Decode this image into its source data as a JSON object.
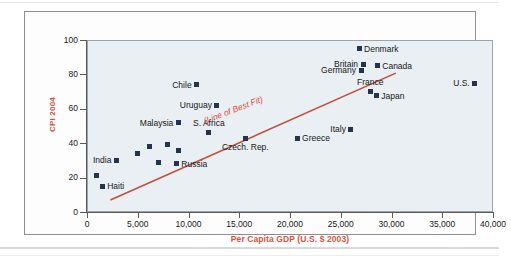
{
  "figure": {
    "background_color": "#e9eff2",
    "accent_color": "#d94f3d",
    "marker_color": "#24344d"
  },
  "chart_data": {
    "type": "scatter",
    "title": "",
    "xlabel": "Per Capita GDP (U.S. $ 2003)",
    "ylabel": "CPI 2004",
    "xlim": [
      0,
      40000
    ],
    "ylim": [
      0,
      100
    ],
    "grid": false,
    "legend": "none",
    "xticks": [
      0,
      5000,
      10000,
      15000,
      20000,
      25000,
      30000,
      35000,
      40000
    ],
    "xticklabels": [
      "0",
      "5,000",
      "10,000",
      "15,000",
      "20,000",
      "25,000",
      "30,000",
      "35,000",
      "40,000"
    ],
    "yticks": [
      0,
      20,
      40,
      60,
      80,
      100
    ],
    "yticklabels": [
      "0",
      "20",
      "40",
      "60",
      "80",
      "100"
    ],
    "annotations": [
      {
        "text": "(Line of Best Fit)",
        "x": 11500,
        "y": 53,
        "color": "#d94f3d",
        "style": "italic",
        "rotation_deg": -21
      }
    ],
    "best_fit_line": {
      "x_start": 0,
      "y_start": 13.5,
      "x_end": 28000,
      "y_end": 87,
      "color": "#c0503f"
    },
    "points": [
      {
        "name": "Haiti",
        "x": 1500,
        "y": 15.0,
        "label": "Haiti",
        "label_pos": "right"
      },
      {
        "name": "unlabeled-1",
        "x": 900,
        "y": 21.0,
        "label": "",
        "label_pos": "right"
      },
      {
        "name": "India",
        "x": 2900,
        "y": 30.0,
        "label": "India",
        "label_pos": "left"
      },
      {
        "name": "unlabeled-2",
        "x": 5000,
        "y": 34.0,
        "label": "",
        "label_pos": "right"
      },
      {
        "name": "unlabeled-3",
        "x": 6200,
        "y": 38.0,
        "label": "",
        "label_pos": "right"
      },
      {
        "name": "unlabeled-4",
        "x": 7000,
        "y": 29.0,
        "label": "",
        "label_pos": "right"
      },
      {
        "name": "unlabeled-5",
        "x": 7900,
        "y": 39.5,
        "label": "",
        "label_pos": "right"
      },
      {
        "name": "unlabeled-6",
        "x": 9000,
        "y": 36.0,
        "label": "",
        "label_pos": "right"
      },
      {
        "name": "Russia",
        "x": 8800,
        "y": 28.0,
        "label": "Russia",
        "label_pos": "right"
      },
      {
        "name": "Malaysia",
        "x": 9000,
        "y": 52.0,
        "label": "Malaysia",
        "label_pos": "left"
      },
      {
        "name": "S. Africa",
        "x": 12000,
        "y": 46.0,
        "label": "S. Africa",
        "label_pos": "above"
      },
      {
        "name": "Chile",
        "x": 10800,
        "y": 74.0,
        "label": "Chile",
        "label_pos": "left"
      },
      {
        "name": "Uruguay",
        "x": 12800,
        "y": 62.0,
        "label": "Uruguay",
        "label_pos": "left"
      },
      {
        "name": "Czech. Rep.",
        "x": 15600,
        "y": 42.5,
        "label": "Czech. Rep.",
        "label_pos": "below"
      },
      {
        "name": "Greece",
        "x": 20700,
        "y": 43.0,
        "label": "Greece",
        "label_pos": "right"
      },
      {
        "name": "Italy",
        "x": 26000,
        "y": 48.0,
        "label": "Italy",
        "label_pos": "left"
      },
      {
        "name": "Denmark",
        "x": 26800,
        "y": 95.0,
        "label": "Denmark",
        "label_pos": "right"
      },
      {
        "name": "Britain",
        "x": 27200,
        "y": 86.0,
        "label": "Britain",
        "label_pos": "left"
      },
      {
        "name": "Germany",
        "x": 27000,
        "y": 82.5,
        "label": "Germany",
        "label_pos": "left"
      },
      {
        "name": "Canada",
        "x": 28600,
        "y": 85.0,
        "label": "Canada",
        "label_pos": "right"
      },
      {
        "name": "France",
        "x": 27900,
        "y": 70.0,
        "label": "France",
        "label_pos": "above"
      },
      {
        "name": "Japan",
        "x": 28500,
        "y": 67.5,
        "label": "Japan",
        "label_pos": "right"
      },
      {
        "name": "U.S.",
        "x": 38200,
        "y": 75.0,
        "label": "U.S.",
        "label_pos": "left"
      }
    ]
  }
}
